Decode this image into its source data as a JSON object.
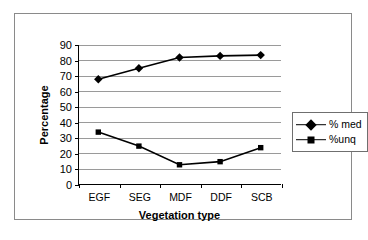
{
  "chart_data": {
    "type": "line",
    "title": "",
    "xlabel": "Vegetation type",
    "ylabel": "Percentage",
    "categories": [
      "EGF",
      "SEG",
      "MDF",
      "DDF",
      "SCB"
    ],
    "ylim": [
      0,
      90
    ],
    "ytick_step": 10,
    "yticks": [
      "0",
      "10",
      "20",
      "30",
      "40",
      "50",
      "60",
      "70",
      "80",
      "90"
    ],
    "grid": "horizontal",
    "legend_position": "right-outside",
    "series": [
      {
        "name": "% med",
        "marker": "diamond",
        "color": "#000000",
        "values": [
          68,
          75,
          82,
          83,
          83.5
        ]
      },
      {
        "name": "%unq",
        "marker": "square",
        "color": "#000000",
        "values": [
          34,
          25,
          13,
          15,
          24
        ]
      }
    ]
  },
  "legend": {
    "items": [
      {
        "label": "% med",
        "marker": "diamond-marker-icon"
      },
      {
        "label": "%unq",
        "marker": "square-marker-icon"
      }
    ]
  }
}
